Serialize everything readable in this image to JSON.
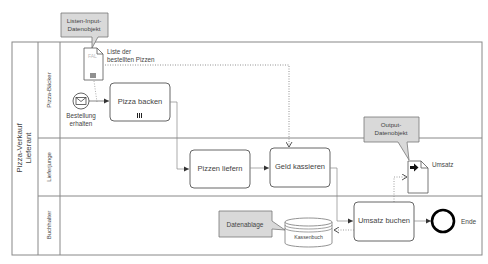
{
  "diagram": {
    "type": "BPMN process",
    "pool": {
      "label_line1": "Pizza-Verkauf",
      "label_line2": "Lieferant"
    },
    "lanes": [
      {
        "id": "lane-baecker",
        "label": "Pizza-Bäcker"
      },
      {
        "id": "lane-lieferjunge",
        "label": "Lieferjunge"
      },
      {
        "id": "lane-buchhalter",
        "label": "Buchhalter"
      }
    ],
    "callouts": {
      "input": {
        "line1": "Listen-Input-",
        "line2": "Datenobjekt"
      },
      "output": {
        "line1": "Output-",
        "line2": "Datenobjekt"
      },
      "store": {
        "line1": "Datenablage"
      }
    },
    "data_objects": {
      "input_list": {
        "label_line1": "Liste der",
        "label_line2": "bestellten Pizzen",
        "marker": "III"
      },
      "output": {
        "label": "Umsatz"
      }
    },
    "data_store": {
      "label": "Kassenbuch"
    },
    "events": {
      "start": {
        "label_line1": "Bestellung",
        "label_line2": "erhalten",
        "type": "message-start"
      },
      "end": {
        "label": "Ende"
      }
    },
    "tasks": [
      {
        "id": "task-pizza-backen",
        "label": "Pizza backen",
        "marker": "III"
      },
      {
        "id": "task-pizzen-liefern",
        "label": "Pizzen liefern"
      },
      {
        "id": "task-geld-kassieren",
        "label": "Geld kassieren"
      },
      {
        "id": "task-umsatz-buchen",
        "label": "Umsatz buchen"
      }
    ],
    "colors": {
      "stroke": "#777777",
      "callout_fill": "#d9d9d9",
      "end_event_stroke": "#000000",
      "text": "#444444"
    }
  }
}
